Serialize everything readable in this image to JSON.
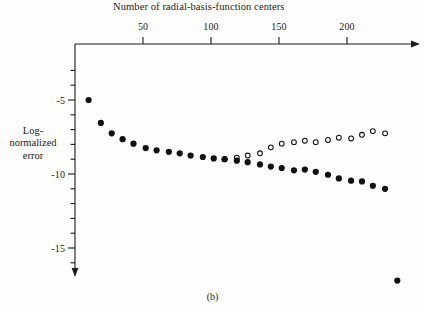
{
  "figure": {
    "caption": "(b)",
    "background_color": "#fdfdfb",
    "ink_color": "#1b1b1b"
  },
  "chart_data": {
    "type": "scatter",
    "title": "",
    "xlabel": "Number of radial-basis-function centers",
    "ylabel": "Log-normalized error",
    "ylabel_lines": [
      "Log-",
      "normalized",
      "error"
    ],
    "xlim": [
      0,
      237
    ],
    "ylim": [
      -18.5,
      -2.8
    ],
    "xticks": [
      50,
      100,
      150,
      200
    ],
    "xtick_labels": [
      "50",
      "100",
      "150",
      "200"
    ],
    "x_minor_tick_interval": 10,
    "yticks": [
      -5,
      -10,
      -15
    ],
    "ytick_labels": [
      "-5",
      "-10",
      "-15"
    ],
    "y_minor_tick_interval": 1,
    "grid": false,
    "legend": null,
    "axis_style": "arrow-terminated L-axes, ticks outward",
    "series": [
      {
        "name": "filled-circles",
        "marker": "filled-circle",
        "marker_color": "#111111",
        "marker_size": 4.4,
        "x": [
          10,
          19,
          27,
          35,
          43,
          52,
          60,
          69,
          77,
          85,
          94,
          102,
          110,
          119,
          127,
          136,
          144,
          152,
          161,
          169,
          177,
          186,
          194,
          203,
          211,
          219,
          228,
          237
        ],
        "y": [
          -5.0,
          -6.55,
          -7.25,
          -7.65,
          -7.95,
          -8.25,
          -8.4,
          -8.5,
          -8.6,
          -8.75,
          -8.85,
          -8.95,
          -9.0,
          -9.1,
          -9.2,
          -9.35,
          -9.5,
          -9.6,
          -9.75,
          -9.7,
          -9.85,
          -10.05,
          -10.3,
          -10.45,
          -10.5,
          -10.8,
          -11.0,
          -17.2
        ]
      },
      {
        "name": "open-circles",
        "marker": "open-circle",
        "marker_color": "#111111",
        "marker_size": 4.0,
        "x": [
          110,
          119,
          127,
          136,
          144,
          152,
          161,
          169,
          177,
          186,
          194,
          203,
          211,
          219,
          228
        ],
        "y": [
          -9.0,
          -8.9,
          -8.75,
          -8.6,
          -8.2,
          -7.95,
          -7.85,
          -7.75,
          -7.85,
          -7.7,
          -7.55,
          -7.6,
          -7.35,
          -7.1,
          -7.25
        ]
      }
    ]
  }
}
